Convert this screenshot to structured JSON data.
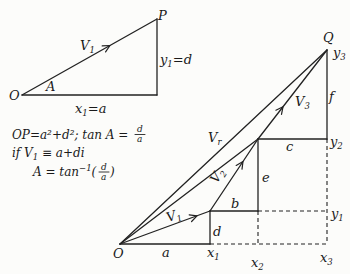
{
  "left_diagram": {
    "origin_label": "O",
    "point_label": "P",
    "vector": {
      "main": "V",
      "sub": "1"
    },
    "angle_label": "A",
    "base_label": {
      "main": "x",
      "sub": "1",
      "rest": "=a"
    },
    "side_label": {
      "main": "y",
      "sub": "1",
      "rest": "=d"
    }
  },
  "formulas": {
    "line1": {
      "text": "OP=a²+d²; tan A =",
      "frac_num": "d",
      "frac_den": "a"
    },
    "line2": {
      "pre": "if V",
      "sub": "1",
      "post": " ≡ a+di"
    },
    "line3": {
      "pre": "A = tan",
      "sup": "−1",
      "open": "(",
      "frac_num": "d",
      "frac_den": "a",
      "close": ")"
    }
  },
  "right_diagram": {
    "origin_label": "O",
    "resultant_end_label": "Q",
    "components": {
      "a": "a",
      "b": "b",
      "c": "c",
      "d": "d",
      "e": "e",
      "f": "f"
    },
    "x_axis": [
      {
        "main": "x",
        "sub": "1"
      },
      {
        "main": "x",
        "sub": "2"
      },
      {
        "main": "x",
        "sub": "3"
      }
    ],
    "y_axis": [
      {
        "main": "y",
        "sub": "1"
      },
      {
        "main": "y",
        "sub": "2"
      },
      {
        "main": "y",
        "sub": "3"
      }
    ],
    "vectors": [
      {
        "main": "V",
        "sub": "1"
      },
      {
        "main": "V",
        "sub": "2"
      },
      {
        "main": "V",
        "sub": "3"
      },
      {
        "main": "V",
        "sub": "r"
      }
    ]
  }
}
